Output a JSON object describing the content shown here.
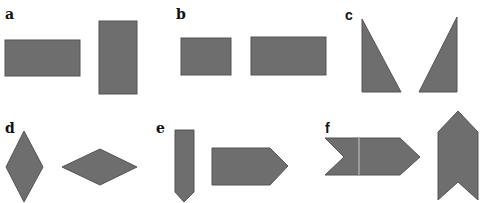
{
  "figure": {
    "fill_color": "#6e6e6e",
    "stroke_color": "#555555",
    "panels": [
      {
        "id": "a",
        "label": "a",
        "description": "Two rectangles: one horizontal, one vertical"
      },
      {
        "id": "b",
        "label": "b",
        "description": "Two horizontal rectangles of different sizes"
      },
      {
        "id": "c",
        "label": "c",
        "description": "Two right triangles, mirror images"
      },
      {
        "id": "d",
        "label": "d",
        "description": "Two rhombi: one vertical, one horizontal"
      },
      {
        "id": "e",
        "label": "e",
        "description": "Two pentagon arrows: one pointing down, one pointing right"
      },
      {
        "id": "f",
        "label": "f",
        "description": "Two chevron shapes: one pointing right, one pointing up"
      }
    ]
  }
}
